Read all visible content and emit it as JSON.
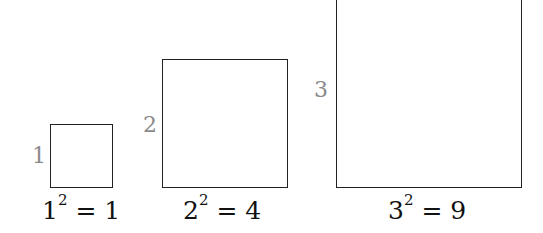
{
  "squares": [
    {
      "side_label": "1",
      "base": "1",
      "exp": "2",
      "rhs": "1",
      "x": 50,
      "y": 124,
      "w": 63,
      "h": 64
    },
    {
      "side_label": "2",
      "base": "2",
      "exp": "2",
      "rhs": "4",
      "x": 162,
      "y": 59,
      "w": 126,
      "h": 129
    },
    {
      "side_label": "3",
      "base": "3",
      "exp": "2",
      "rhs": "9",
      "x": 336,
      "y": -10,
      "w": 186,
      "h": 198
    }
  ],
  "equals": "="
}
